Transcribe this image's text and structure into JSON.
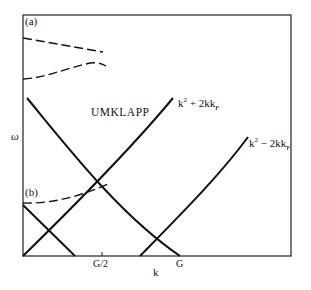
{
  "diagram": {
    "panels": {
      "a": "(a)",
      "b": "(b)"
    },
    "region_label": "UMKLAPP",
    "curves": {
      "plus": {
        "label_base": "k",
        "label_sup": "2",
        "label_mid": " + 2kk",
        "label_sub": "F"
      },
      "minus": {
        "label_base": "k",
        "label_sup": "2",
        "label_mid": " − 2kk",
        "label_sub": "F"
      }
    },
    "x_axis": {
      "label": "k",
      "ticks": [
        "G/2",
        "G"
      ]
    },
    "y_axis": {
      "label": "ω"
    },
    "colors": {
      "line": "#111111",
      "background": "#ffffff"
    }
  }
}
